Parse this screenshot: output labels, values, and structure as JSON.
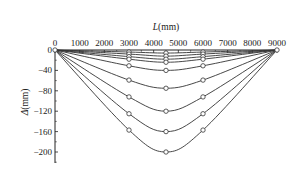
{
  "chart_data": {
    "type": "line",
    "title": "",
    "xlabel": "L(mm)",
    "xlabel_symbol": "L",
    "xlabel_unit": "(mm)",
    "ylabel": "Δ(mm)",
    "ylabel_symbol": "Δ",
    "ylabel_unit": "(mm)",
    "xlim": [
      0,
      9000
    ],
    "ylim": [
      -220,
      0
    ],
    "x_axis_position": "top",
    "x_ticks": [
      0,
      1000,
      2000,
      3000,
      4000,
      5000,
      6000,
      7000,
      8000,
      9000
    ],
    "y_ticks": [
      0,
      -40,
      -80,
      -120,
      -160,
      -200
    ],
    "legend": "none",
    "grid": false,
    "marker": "open-circle",
    "x": [
      0,
      3000,
      4500,
      6000,
      9000
    ],
    "series": [
      {
        "name": "curve-1",
        "values": [
          0,
          -4,
          -6,
          -4,
          0
        ]
      },
      {
        "name": "curve-2",
        "values": [
          0,
          -8,
          -12,
          -8,
          0
        ]
      },
      {
        "name": "curve-3",
        "values": [
          0,
          -13,
          -18,
          -13,
          0
        ]
      },
      {
        "name": "curve-4",
        "values": [
          0,
          -18,
          -24,
          -18,
          0
        ]
      },
      {
        "name": "curve-5",
        "values": [
          0,
          -31,
          -40,
          -31,
          0
        ]
      },
      {
        "name": "curve-6",
        "values": [
          0,
          -59,
          -75,
          -59,
          0
        ]
      },
      {
        "name": "curve-7",
        "values": [
          0,
          -92,
          -120,
          -92,
          0
        ]
      },
      {
        "name": "curve-8",
        "values": [
          0,
          -125,
          -160,
          -125,
          0
        ]
      },
      {
        "name": "curve-9",
        "values": [
          0,
          -157,
          -200,
          -157,
          0
        ]
      }
    ]
  },
  "colors": {
    "line": "#333333",
    "axis": "#222222",
    "marker_fill": "#ffffff"
  }
}
